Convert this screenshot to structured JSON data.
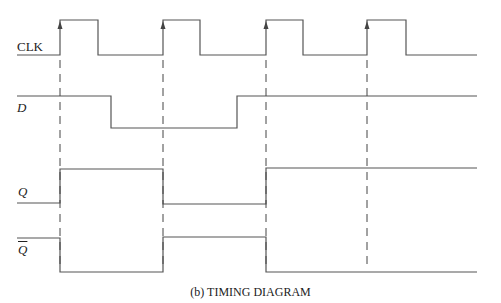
{
  "caption": "(b)  TIMING DIAGRAM",
  "signals": [
    {
      "name": "CLK",
      "italic": false
    },
    {
      "name": "D",
      "italic": true
    },
    {
      "name": "Q",
      "italic": true
    },
    {
      "name": "Q",
      "italic": true,
      "overbar": true
    }
  ],
  "colors": {
    "trace": "#555555",
    "text": "#222222",
    "background": "#ffffff"
  },
  "diagram": {
    "type": "timing",
    "clock_rising_edges_x": [
      60,
      163,
      266,
      367
    ],
    "clock_falling_edges_x": [
      98,
      200,
      303,
      406
    ],
    "waveforms": {
      "CLK": "low,high,low,high,low,high,low,high,low",
      "D": "high until between edge1 and edge2, low until between edge2 and edge3, then high",
      "Q": "low; high at edge1; low at edge2; high at edge3 onward",
      "Q_bar": "high; low at edge1; high at edge2; low at edge3 onward"
    }
  }
}
